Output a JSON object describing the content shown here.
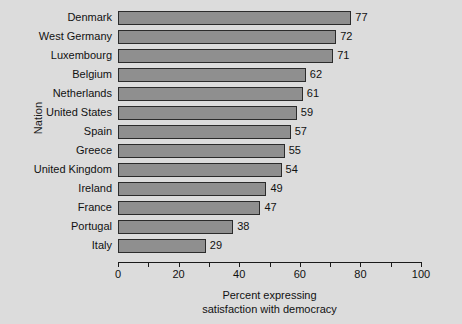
{
  "chart_data": {
    "type": "bar",
    "orientation": "horizontal",
    "title": "",
    "xlabel_line1": "Percent expressing",
    "xlabel_line2": "satisfaction with democracy",
    "ylabel": "Nation",
    "xlim": [
      0,
      100
    ],
    "xticks": [
      0,
      20,
      40,
      60,
      80,
      100
    ],
    "xtick_labels": [
      "0",
      "20",
      "40",
      "60",
      "80",
      "100"
    ],
    "minor_tick_interval": 10,
    "grid": false,
    "legend": false,
    "bar_fill_color": "#8f8f8f",
    "bar_edge_color": "#2b2b2b",
    "background_color": "#dcdcdc",
    "categories": [
      "Denmark",
      "West Germany",
      "Luxembourg",
      "Belgium",
      "Netherlands",
      "United States",
      "Spain",
      "Greece",
      "United Kingdom",
      "Ireland",
      "France",
      "Portugal",
      "Italy"
    ],
    "values": [
      77,
      72,
      71,
      62,
      61,
      59,
      57,
      55,
      54,
      49,
      47,
      38,
      29
    ],
    "value_labels": [
      "77",
      "72",
      "71",
      "62",
      "61",
      "59",
      "57",
      "55",
      "54",
      "49",
      "47",
      "38",
      "29"
    ]
  }
}
